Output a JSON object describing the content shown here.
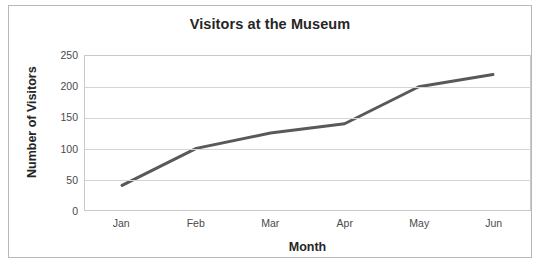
{
  "chart_data": {
    "type": "line",
    "title": "Visitors at the Museum",
    "xlabel": "Month",
    "ylabel": "Number of Visitors",
    "categories": [
      "Jan",
      "Feb",
      "Mar",
      "Apr",
      "May",
      "Jun"
    ],
    "values": [
      40,
      100,
      125,
      140,
      200,
      220
    ],
    "series": [
      {
        "name": "Number of Visitors",
        "values": [
          40,
          100,
          125,
          140,
          200,
          220
        ],
        "color": "#595959",
        "line_width": 3,
        "markers": false
      }
    ],
    "ylim": [
      0,
      250
    ],
    "yticks": [
      0,
      50,
      100,
      150,
      200,
      250
    ],
    "ytick_labels": [
      "0",
      "50",
      "100",
      "150",
      "200",
      "250"
    ],
    "grid": {
      "horizontal": true,
      "vertical": false,
      "color": "#d4d4d4"
    },
    "legend": {
      "visible": false,
      "position": "none"
    },
    "plot_border_color": "#c9c9c9",
    "page_border_color": "#b8b8b8",
    "text_color": "#262626",
    "tick_text_color": "#4a4a4a"
  }
}
